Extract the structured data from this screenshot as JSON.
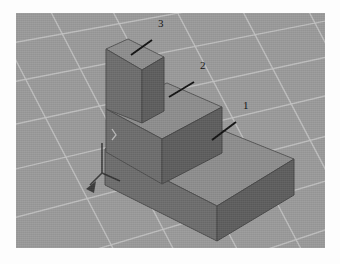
{
  "scene": {
    "title": "3D Stepped Block Assembly",
    "view": "isometric",
    "background_color": "#9a9a9a",
    "grid_line_color": "#c3c3c3",
    "page_background": "#ffffff",
    "render_area": {
      "x": 16,
      "y": 13,
      "width": 309,
      "height": 235
    }
  },
  "materials": {
    "top_face_color": "#8d8d8d",
    "left_face_color": "#6f6f6f",
    "right_face_color": "#5e5e5e",
    "edge_color": "#4a4a4a",
    "leader_color": "#111111"
  },
  "callouts": [
    {
      "id": "callout-1",
      "label": "1",
      "target": "base-block",
      "text_x": 243,
      "text_y": 104,
      "leader_from_x": 236,
      "leader_from_y": 109,
      "leader_to_x": 212,
      "leader_to_y": 127
    },
    {
      "id": "callout-2",
      "label": "2",
      "target": "middle-block",
      "text_x": 200,
      "text_y": 64,
      "leader_from_x": 194,
      "leader_from_y": 69,
      "leader_to_x": 169,
      "leader_to_y": 84
    },
    {
      "id": "callout-3",
      "label": "3",
      "target": "top-block",
      "text_x": 158,
      "text_y": 22,
      "leader_from_x": 152,
      "leader_from_y": 27,
      "leader_to_x": 131,
      "leader_to_y": 42
    }
  ],
  "solids": [
    {
      "id": "base-block",
      "name": "Base Block",
      "callout": "1",
      "description": "Largest bottom slab of the stepped assembly"
    },
    {
      "id": "middle-block",
      "name": "Middle Block",
      "callout": "2",
      "description": "Intermediate step resting on the base block"
    },
    {
      "id": "top-block",
      "name": "Top Block",
      "callout": "3",
      "description": "Tall narrow column at the rear of the assembly"
    }
  ],
  "origin_marker": {
    "id": "origin-axis-marker",
    "name": "origin axis indicator",
    "x": 104,
    "y": 172
  }
}
